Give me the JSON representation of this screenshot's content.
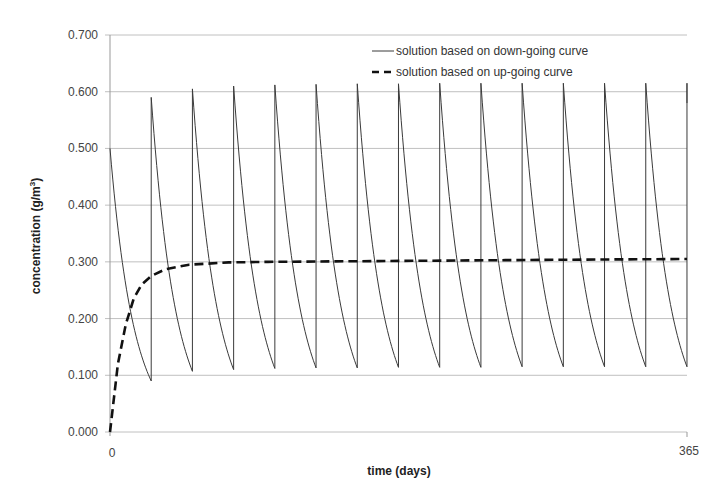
{
  "chart_data": {
    "type": "line",
    "title": "",
    "xlabel": "time (days)",
    "ylabel": "concentration (g/m³)",
    "xlim": [
      0,
      365
    ],
    "ylim": [
      0,
      0.7
    ],
    "x_ticks": [
      "0",
      "365"
    ],
    "y_ticks": [
      "0.000",
      "0.100",
      "0.200",
      "0.300",
      "0.400",
      "0.500",
      "0.600",
      "0.700"
    ],
    "grid": {
      "horizontal": true,
      "vertical": false
    },
    "legend_position": "top-right inside",
    "series": [
      {
        "name": "solution based on down-going curve",
        "style": "solid thin",
        "description": "sawtooth: periodic pulse every ~26 days, exponential decay between pulses",
        "period_days": 26.07,
        "initial_value": 0.5,
        "peaks": [
          0.5,
          0.59,
          0.605,
          0.61,
          0.612,
          0.613,
          0.614,
          0.614,
          0.615,
          0.615,
          0.615,
          0.615,
          0.615,
          0.615
        ],
        "troughs": [
          0.09,
          0.107,
          0.11,
          0.112,
          0.113,
          0.113,
          0.114,
          0.114,
          0.114,
          0.115,
          0.115,
          0.115,
          0.115,
          0.115
        ]
      },
      {
        "name": "solution based on up-going curve",
        "style": "dashed thick",
        "x": [
          0,
          5,
          10,
          15,
          20,
          26,
          35,
          50,
          75,
          100,
          150,
          200,
          250,
          300,
          365
        ],
        "values": [
          0.0,
          0.12,
          0.19,
          0.235,
          0.26,
          0.275,
          0.287,
          0.295,
          0.299,
          0.3,
          0.301,
          0.302,
          0.303,
          0.304,
          0.305
        ]
      }
    ]
  },
  "legend": {
    "items": [
      {
        "label": "solution based on down-going curve",
        "style": "solid"
      },
      {
        "label": "solution based on up-going curve",
        "style": "dashed"
      }
    ]
  },
  "axes": {
    "x_title": "time (days)",
    "y_title_main": "concentration (g/m",
    "y_title_sup": "3",
    "y_title_close": ")",
    "x_tick_0": "0",
    "x_tick_end": "365"
  },
  "colors": {
    "gridline": "#b0b0b0",
    "solid_line": "#3a3a3a",
    "dashed_line": "#111111",
    "text": "#333333"
  }
}
